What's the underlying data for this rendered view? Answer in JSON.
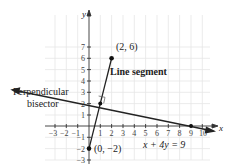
{
  "diagram": {
    "axes": {
      "x_label": "x",
      "y_label": "y",
      "x_ticks": [
        "−3",
        "−2",
        "−1",
        "1",
        "2",
        "3",
        "4",
        "5",
        "6",
        "7",
        "8",
        "9",
        "10"
      ],
      "y_ticks": [
        "7",
        "6",
        "5",
        "4",
        "3",
        "2",
        "1",
        "−1",
        "−2",
        "−3"
      ]
    },
    "points": {
      "p1": "(2, 6)",
      "p2": "(0, −2)"
    },
    "labels": {
      "segment": "Line segment",
      "bisector_line1": "Perpendicular",
      "bisector_line2": "bisector",
      "equation": "x + 4y = 9"
    },
    "colors": {
      "line": "#222222",
      "grid": "#e6e6e6",
      "axis": "#333333"
    }
  }
}
